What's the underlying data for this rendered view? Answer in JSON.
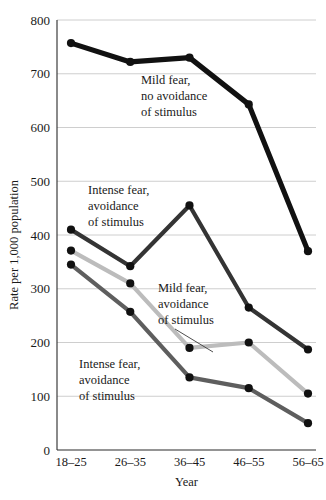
{
  "chart_data": {
    "type": "line",
    "title": "",
    "xlabel": "Year",
    "ylabel": "Rate per 1,000 population",
    "categories": [
      "18–25",
      "26–35",
      "36–45",
      "46–55",
      "56–65"
    ],
    "ylim": [
      0,
      800
    ],
    "yticks": [
      0,
      100,
      200,
      300,
      400,
      500,
      600,
      700,
      800
    ],
    "ytick_labels": [
      "0",
      "100",
      "200",
      "300",
      "400",
      "500",
      "600",
      "700",
      "800"
    ],
    "grid": true,
    "legend": "annotations-inline",
    "series": [
      {
        "name": "Mild fear, no avoidance of stimulus",
        "color": "#111111",
        "width": 5.2,
        "marker": "circle",
        "values": [
          757,
          722,
          730,
          643,
          370
        ]
      },
      {
        "name": "Intense fear, avoidance of stimulus (upper)",
        "color": "#343434",
        "width": 4.2,
        "marker": "circle",
        "values": [
          410,
          342,
          455,
          265,
          187
        ]
      },
      {
        "name": "Mild fear, avoidance of stimulus",
        "color": "#bcbcbc",
        "width": 4.2,
        "marker": "circle",
        "values": [
          371,
          310,
          190,
          200,
          105
        ]
      },
      {
        "name": "Intense fear, avoidance of stimulus (lower)",
        "color": "#5e5e5e",
        "width": 4.2,
        "marker": "circle",
        "values": [
          345,
          257,
          135,
          115,
          50
        ]
      }
    ],
    "annotations": [
      {
        "id": "mild-no-avoidance",
        "lines": [
          "Mild fear,",
          "no avoidance",
          "of stimulus"
        ],
        "x": 141,
        "y": 84,
        "leader": false
      },
      {
        "id": "intense-avoidance-upper",
        "lines": [
          "Intense fear,",
          "avoidance",
          "of stimulus"
        ],
        "x": 88,
        "y": 194,
        "leader": false
      },
      {
        "id": "mild-avoidance",
        "lines": [
          "Mild fear,",
          "avoidance",
          "of stimulus"
        ],
        "x": 158,
        "y": 292,
        "leader": true,
        "leader_from": [
          175,
          329
        ],
        "leader_to": [
          213,
          352
        ]
      },
      {
        "id": "intense-avoidance-lower",
        "lines": [
          "Intense fear,",
          "avoidance",
          "of stimulus"
        ],
        "x": 79,
        "y": 368,
        "leader": false
      }
    ]
  },
  "caption": {
    "text": " "
  }
}
